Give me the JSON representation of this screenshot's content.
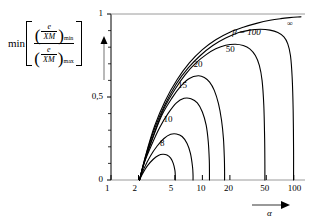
{
  "figure": {
    "ylabel": {
      "min_word": "min",
      "numerator": {
        "var_num": "e",
        "var_den": "XM",
        "subscript": "min"
      },
      "denominator": {
        "var_num": "e",
        "var_den": "XM",
        "subscript": "max"
      }
    },
    "xaxis_name": "α",
    "line_color": "#000000",
    "axis_color": "#000000"
  },
  "chart_data": {
    "type": "line",
    "title": "",
    "xlabel": "α",
    "ylabel": "min[(e/XM)min / (e/XM)max]",
    "xscale": "log",
    "xlim": [
      1,
      120
    ],
    "ylim": [
      0,
      1
    ],
    "xticks": [
      1,
      2,
      5,
      10,
      20,
      50,
      100
    ],
    "xtick_labels": [
      "1",
      "2",
      "5",
      "10",
      "20",
      "50",
      "100"
    ],
    "yticks": [
      0,
      0.5,
      1
    ],
    "ytick_labels": [
      "0",
      "0,5",
      "1"
    ],
    "yminorticks": [
      0.1,
      0.2,
      0.3,
      0.4,
      0.6,
      0.7,
      0.8,
      0.9
    ],
    "grid": false,
    "legend": "inline-curve-labels",
    "series": [
      {
        "name": "8",
        "label": "8",
        "label_x": 4.2,
        "label_y": 0.215,
        "x": [
          2.05,
          2.2,
          2.5,
          2.9,
          3.3,
          3.7,
          4.1,
          4.5,
          4.8,
          5.0,
          5.05,
          5.05
        ],
        "y": [
          0.0,
          0.035,
          0.085,
          0.125,
          0.148,
          0.155,
          0.15,
          0.132,
          0.1,
          0.06,
          0.03,
          0.0
        ]
      },
      {
        "name": "10",
        "label": "10",
        "label_x": 4.6,
        "label_y": 0.36,
        "x": [
          2.05,
          2.3,
          2.7,
          3.2,
          3.8,
          4.5,
          5.2,
          6.0,
          6.8,
          7.4,
          7.8,
          7.9,
          7.9
        ],
        "y": [
          0.0,
          0.07,
          0.145,
          0.205,
          0.25,
          0.275,
          0.277,
          0.262,
          0.22,
          0.16,
          0.08,
          0.03,
          0.0
        ]
      },
      {
        "name": "15",
        "label": "15",
        "label_x": 6.6,
        "label_y": 0.565,
        "x": [
          2.05,
          2.3,
          2.8,
          3.4,
          4.2,
          5.2,
          6.3,
          7.5,
          8.8,
          10.0,
          11.0,
          11.6,
          11.9,
          11.95,
          11.95
        ],
        "y": [
          0.0,
          0.1,
          0.215,
          0.315,
          0.4,
          0.465,
          0.492,
          0.49,
          0.465,
          0.41,
          0.33,
          0.23,
          0.12,
          0.05,
          0.0
        ]
      },
      {
        "name": "20",
        "label": "20",
        "label_x": 9.8,
        "label_y": 0.69,
        "x": [
          2.05,
          2.35,
          2.9,
          3.6,
          4.6,
          5.8,
          7.2,
          9.0,
          10.5,
          12.0,
          13.5,
          15.0,
          16.2,
          17.0,
          17.4,
          17.5,
          17.5
        ],
        "y": [
          0.0,
          0.12,
          0.26,
          0.39,
          0.49,
          0.565,
          0.612,
          0.628,
          0.618,
          0.59,
          0.54,
          0.46,
          0.36,
          0.25,
          0.13,
          0.05,
          0.0
        ]
      },
      {
        "name": "50",
        "label": "50",
        "label_x": 22.0,
        "label_y": 0.785,
        "x": [
          2.05,
          2.4,
          3.0,
          3.8,
          5.0,
          6.5,
          8.5,
          11.0,
          14.0,
          18.0,
          23.0,
          28.0,
          33.0,
          38.0,
          42.0,
          45.0,
          47.0,
          48.0,
          48.3,
          48.3
        ],
        "y": [
          0.0,
          0.135,
          0.29,
          0.43,
          0.545,
          0.635,
          0.705,
          0.755,
          0.79,
          0.812,
          0.818,
          0.81,
          0.79,
          0.75,
          0.69,
          0.6,
          0.45,
          0.25,
          0.09,
          0.0
        ]
      },
      {
        "name": "100",
        "label": "β = 100",
        "label_x": 26.0,
        "label_y": 0.885,
        "x": [
          2.05,
          2.4,
          3.0,
          3.9,
          5.2,
          7.0,
          9.5,
          13.0,
          18.0,
          25.0,
          33.0,
          43.0,
          55.0,
          67.0,
          78.0,
          86.0,
          92.0,
          96.0,
          98.5,
          99.5,
          99.5
        ],
        "y": [
          0.0,
          0.145,
          0.31,
          0.455,
          0.58,
          0.675,
          0.75,
          0.81,
          0.855,
          0.888,
          0.903,
          0.908,
          0.903,
          0.888,
          0.862,
          0.82,
          0.75,
          0.62,
          0.42,
          0.18,
          0.0
        ]
      },
      {
        "name": "inf",
        "label": "∞",
        "label_x": 103.0,
        "label_y": 0.935,
        "x": [
          2.05,
          2.4,
          3.0,
          3.9,
          5.3,
          7.2,
          10.0,
          14.0,
          20.0,
          28.0,
          40.0,
          55.0,
          72.0,
          90.0,
          110.0,
          120.0
        ],
        "y": [
          0.0,
          0.15,
          0.325,
          0.475,
          0.605,
          0.705,
          0.785,
          0.845,
          0.89,
          0.92,
          0.945,
          0.962,
          0.972,
          0.978,
          0.982,
          0.983
        ]
      }
    ]
  }
}
